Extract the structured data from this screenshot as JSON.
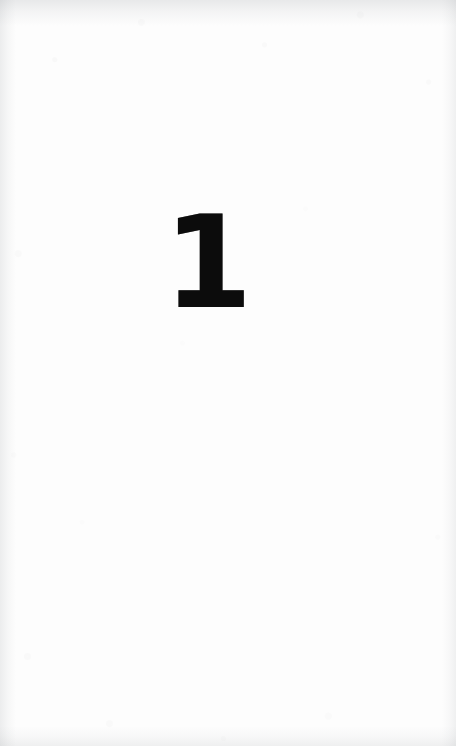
{
  "page": {
    "kind": "scanned-book-page",
    "width": 456,
    "height": 746,
    "paper_color": "#fdfdfd",
    "edge_shadow_color": "#787e84"
  },
  "content": {
    "folio": {
      "text": "1",
      "role": "part-opener-number",
      "ink_color": "#0c0c0c",
      "font_size_px": 128,
      "weight": "bold",
      "center_x_px": 208,
      "baseline_y_px": 297,
      "glyph_height_px": 92
    }
  },
  "decorations": {
    "top_edge_shadow": "scan-vignette-top",
    "left_edge_shadow": "scan-vignette-left",
    "right_edge_shadow": "scan-vignette-right",
    "bottom_edge_shadow": "scan-vignette-bottom",
    "paper_grain": "paper-grain"
  }
}
